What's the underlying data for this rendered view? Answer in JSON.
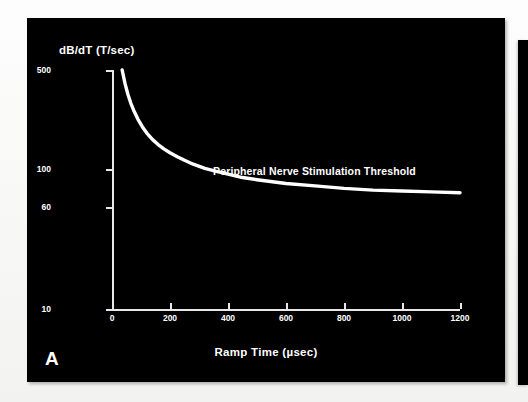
{
  "figure": {
    "panel_letter": "A",
    "background_color": "#000000",
    "ink_color": "#ffffff",
    "page_color": "#ffffff"
  },
  "chart_data": {
    "type": "line",
    "title": "",
    "subtitle": "",
    "xlabel": "Ramp Time (µsec)",
    "ylabel": "dB/dT (T/sec)",
    "annotations": [
      "Peripheral Nerve Stimulation Threshold"
    ],
    "legend": [],
    "legend_position": "none",
    "grid": false,
    "xscale": "linear",
    "yscale": "log",
    "xlim": [
      0,
      1200
    ],
    "ylim": [
      10,
      500
    ],
    "xticks": [
      0,
      200,
      400,
      600,
      800,
      1000,
      1200
    ],
    "xtick_labels": [
      "0",
      "200",
      "400",
      "600",
      "800",
      "1000",
      "1200"
    ],
    "yticks": [
      10,
      60,
      100,
      500
    ],
    "ytick_labels": [
      "10",
      "60",
      "100",
      "500"
    ],
    "series": [
      {
        "name": "Peripheral Nerve Stimulation Threshold",
        "color": "#ffffff",
        "asymptote": 60,
        "x": [
          35,
          45,
          55,
          65,
          75,
          90,
          105,
          120,
          140,
          160,
          180,
          200,
          225,
          250,
          280,
          320,
          360,
          400,
          450,
          500,
          600,
          700,
          800,
          900,
          1000,
          1100,
          1200
        ],
        "y": [
          500,
          400,
          335,
          290,
          258,
          222,
          197,
          178,
          160,
          147,
          137,
          129,
          121,
          114,
          107,
          100,
          95,
          91,
          86,
          83,
          78,
          75,
          72,
          70,
          69,
          68,
          67
        ]
      }
    ]
  },
  "axis_titles": {
    "y": "dB/dT (T/sec)",
    "x": "Ramp Time (µsec)"
  },
  "panel_b": {
    "visible": true,
    "note": ""
  }
}
